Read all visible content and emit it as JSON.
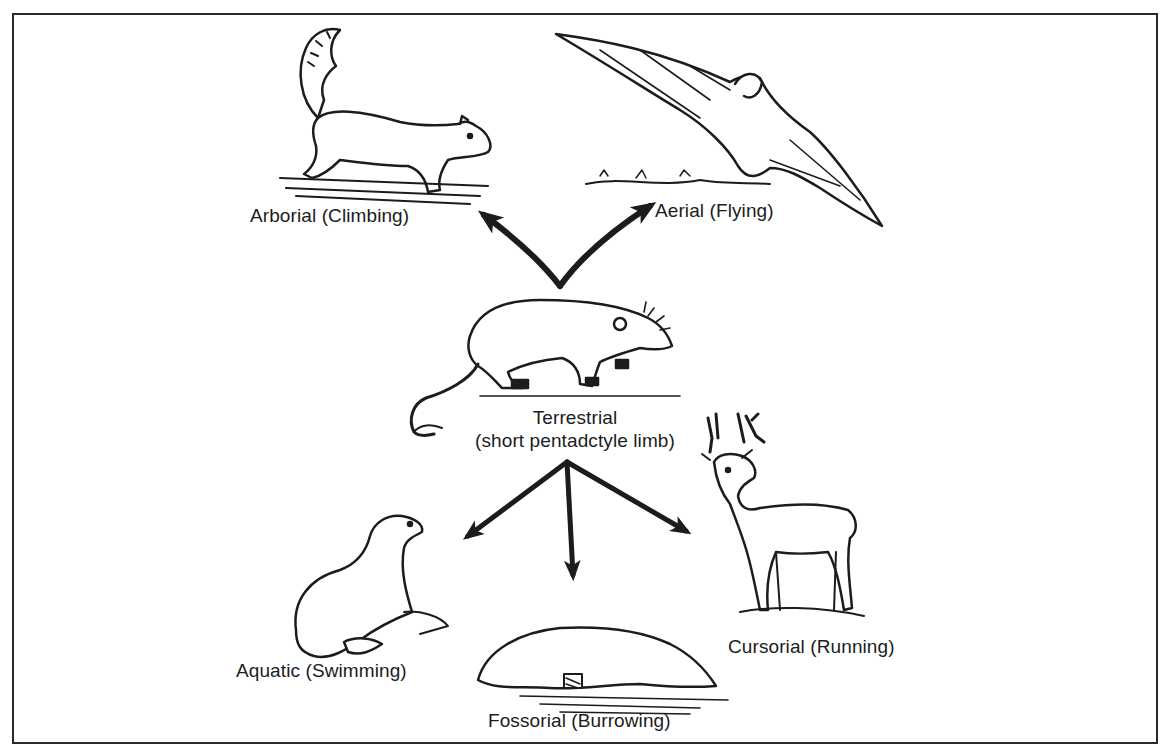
{
  "diagram": {
    "center": {
      "name": "Terrestrial",
      "description": "(short pentadctyle limb)",
      "animal": "shrew-like ancestral mammal"
    },
    "branches": [
      {
        "id": "arborial",
        "label": "Arborial (Climbing)",
        "animal": "squirrel",
        "direction": "up-left"
      },
      {
        "id": "aerial",
        "label": "Aerial (Flying)",
        "animal": "bat",
        "direction": "up-right"
      },
      {
        "id": "aquatic",
        "label": "Aquatic (Swimming)",
        "animal": "seal",
        "direction": "down-left"
      },
      {
        "id": "fossorial",
        "label": "Fossorial (Burrowing)",
        "animal": "mole",
        "direction": "down"
      },
      {
        "id": "cursorial",
        "label": "Cursorial (Running)",
        "animal": "deer",
        "direction": "down-right"
      }
    ],
    "colors": {
      "ink": "#1c1c1c",
      "background": "#ffffff",
      "border": "#2a2a2a"
    }
  }
}
